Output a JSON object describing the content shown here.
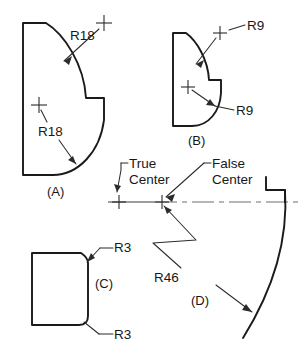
{
  "sheet": {
    "background_color": "#ffffff",
    "line_color": "#1a1a1a",
    "leader_color": "#2b2b2b",
    "centerline_color": "#6e6e6e",
    "width": 308,
    "height": 350
  },
  "figures": [
    {
      "id": "A",
      "label": "(A)",
      "dimensions": [
        {
          "text": "R18",
          "note": "upper concave fillet radius"
        },
        {
          "text": "R18",
          "note": "lower convex arc radius"
        }
      ]
    },
    {
      "id": "B",
      "label": "(B)",
      "dimensions": [
        {
          "text": "R9",
          "note": "upper concave fillet radius"
        },
        {
          "text": "R9",
          "note": "lower convex arc radius"
        }
      ]
    },
    {
      "id": "C",
      "label": "(C)",
      "dimensions": [
        {
          "text": "R3",
          "note": "top right concave notch radius"
        },
        {
          "text": "R3",
          "note": "bottom right convex round radius"
        }
      ]
    },
    {
      "id": "D",
      "label": "(D)",
      "dimensions": [
        {
          "text": "R46",
          "note": "large arc radius struck from false center"
        }
      ],
      "annotations": [
        {
          "text_line_1": "True",
          "text_line_2": "Center",
          "name": "true-center"
        },
        {
          "text_line_1": "False",
          "text_line_2": "Center",
          "name": "false-center"
        }
      ]
    }
  ],
  "labels": {
    "fig_a": "(A)",
    "fig_b": "(B)",
    "fig_c": "(C)",
    "fig_d": "(D)",
    "r18_upper": "R18",
    "r18_lower": "R18",
    "r9_upper": "R9",
    "r9_lower": "R9",
    "r3_upper": "R3",
    "r3_lower": "R3",
    "r46": "R46",
    "true_center_line1": "True",
    "true_center_line2": "Center",
    "false_center_line1": "False",
    "false_center_line2": "Center"
  }
}
